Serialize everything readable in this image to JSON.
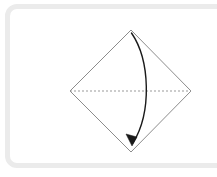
{
  "figure": {
    "caption": "",
    "kind": "fold-instruction"
  },
  "canvas": {
    "width": 217,
    "height": 177,
    "background_color": "#ffffff"
  },
  "card": {
    "border_color": "#ebebeb",
    "border_width": 5,
    "corner_radius": 12,
    "fill_color": "#ffffff"
  },
  "shape": {
    "name": "square-rotated-45",
    "label": "diamond",
    "stroke_color": "#8c8c8c",
    "stroke_width": 1,
    "fill": "none",
    "vertices": {
      "top": {
        "x": 131,
        "y": 30
      },
      "right": {
        "x": 191,
        "y": 91
      },
      "bottom": {
        "x": 131,
        "y": 152
      },
      "left": {
        "x": 70,
        "y": 91
      }
    },
    "points_path": "131,30 191,91 131,152 70,91"
  },
  "fold_line": {
    "name": "horizontal-valley-fold",
    "style": "dashed",
    "stroke_color": "#999999",
    "stroke_width": 1,
    "dash_pattern": "2 2",
    "from": {
      "x": 70,
      "y": 91
    },
    "to": {
      "x": 191,
      "y": 91
    }
  },
  "fold_arrow": {
    "name": "fold-direction-arrow",
    "stroke_color": "#1a1a1a",
    "stroke_width": 1.4,
    "curve_path": "M 131.5 33 C 150 60, 152 112, 133 143",
    "bulge_direction": "right",
    "start_point": {
      "x": 131,
      "y": 33
    },
    "end_point": {
      "x": 133,
      "y": 143
    },
    "max_bulge_x": 146,
    "arrowhead": {
      "name": "arrowhead-triangle",
      "fill_color": "#1a1a1a",
      "points_path": "132,146 126,134 137,137",
      "direction": "down-left"
    }
  },
  "colors": {
    "outline": "#8c8c8c",
    "dashed": "#999999",
    "arrow": "#1a1a1a",
    "frame": "#ebebeb",
    "background": "#ffffff"
  }
}
